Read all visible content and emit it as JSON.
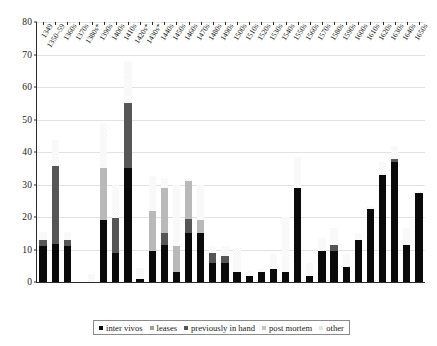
{
  "chart_data": {
    "type": "bar",
    "stacked": true,
    "title": "",
    "xlabel": "",
    "ylabel": "",
    "ylim": [
      0,
      80
    ],
    "ytick_values": [
      0,
      10,
      20,
      30,
      40,
      50,
      60,
      70,
      80
    ],
    "grid": true,
    "legend_position": "bottom",
    "series": [
      {
        "name": "inter vivos",
        "color": "#0a0a0a",
        "values": [
          11,
          11.8,
          11,
          0,
          0,
          19,
          8.8,
          35,
          0.8,
          9.5,
          11.5,
          3,
          15,
          15,
          6,
          6,
          3,
          2,
          3,
          4,
          3,
          29,
          2,
          9.5,
          9.5,
          4.5,
          13,
          22.5,
          33,
          37,
          11.5,
          27.5
        ]
      },
      {
        "name": "leases",
        "color": "#9e9e9e",
        "values": [
          0,
          0,
          0,
          0,
          0,
          0,
          0,
          0,
          0,
          0,
          0,
          0,
          0,
          0,
          0,
          0,
          0,
          0,
          0,
          0,
          0,
          0,
          0,
          0,
          0,
          0,
          0,
          0,
          0,
          0,
          0,
          0
        ]
      },
      {
        "name": "previously in hand",
        "color": "#565656",
        "values": [
          2,
          24,
          2,
          0,
          0,
          0,
          11,
          20,
          0,
          0,
          3.5,
          0,
          4.5,
          0,
          3,
          2,
          0,
          0,
          0,
          0,
          0,
          0,
          0,
          0,
          2,
          0,
          0,
          0,
          0,
          1,
          0,
          0
        ]
      },
      {
        "name": "post mortem",
        "color": "#b9b9b9",
        "values": [
          0,
          0,
          0,
          0,
          0,
          16,
          0,
          0,
          0,
          12.5,
          14,
          8,
          11.5,
          4,
          0,
          0,
          0,
          0,
          0,
          0,
          0,
          0,
          0,
          0,
          0,
          0,
          0,
          0,
          0,
          0,
          0,
          0
        ]
      },
      {
        "name": "other",
        "color": "#e4e4e4",
        "values": [
          2.5,
          8,
          2.5,
          0,
          2.5,
          14,
          10.5,
          13,
          3.5,
          10.5,
          3,
          19,
          1,
          11,
          2,
          3,
          7.5,
          1.5,
          1,
          4.5,
          17,
          9.5,
          4,
          4,
          5,
          4,
          2,
          1,
          4,
          4,
          5,
          0.5
        ]
      }
    ],
    "categories": [
      "1349",
      "1350–59",
      "1360s",
      "1370s",
      "1380s*",
      "1390s",
      "1400s",
      "1410s",
      "1420s*",
      "1430s*",
      "1440s",
      "1450s",
      "1460s",
      "1470s",
      "1480s",
      "1490s",
      "1500s",
      "1510s",
      "1520s",
      "1530s",
      "1540s",
      "1550s",
      "1560s",
      "1570s",
      "1580s",
      "1590s",
      "1600s",
      "1610s",
      "1620s",
      "1630s",
      "1640s",
      "1650s"
    ],
    "totals": [
      15.5,
      43.8,
      15.5,
      0,
      2.5,
      49,
      30.3,
      68,
      4.3,
      32.5,
      32,
      30,
      32,
      30,
      11,
      11,
      10.5,
      3.5,
      4,
      8.5,
      20,
      38.5,
      6,
      13.5,
      16.5,
      8.5,
      15,
      23.5,
      37,
      42,
      16.5,
      28
    ]
  },
  "legend": {
    "items": [
      {
        "label": "inter vivos"
      },
      {
        "label": "leases"
      },
      {
        "label": "previously in hand"
      },
      {
        "label": "post mortem"
      },
      {
        "label": "other"
      }
    ]
  }
}
